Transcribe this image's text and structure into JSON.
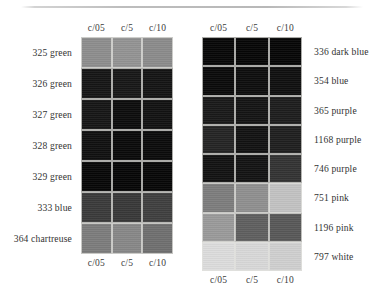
{
  "figure": {
    "type": "color-swatch-grid-figure",
    "divider": "top-horizontal-rule"
  },
  "panels": [
    {
      "id": "left-panel",
      "label_side": "left",
      "columns": [
        "c/05",
        "c/5",
        "c/10"
      ],
      "rows": [
        {
          "label": "325 green",
          "swatches": [
            "#8d8d8d",
            "#939393",
            "#8b8b8b"
          ]
        },
        {
          "label": "326 green",
          "swatches": [
            "#151515",
            "#171717",
            "#141414"
          ]
        },
        {
          "label": "327 green",
          "swatches": [
            "#161616",
            "#0c0c0c",
            "#121212"
          ]
        },
        {
          "label": "328 green",
          "swatches": [
            "#101010",
            "#0a0a0a",
            "#0b0b0b"
          ]
        },
        {
          "label": "329 green",
          "swatches": [
            "#070707",
            "#060606",
            "#070707"
          ]
        },
        {
          "label": "333 blue",
          "swatches": [
            "#3a3a3a",
            "#383838",
            "#3f3f3f"
          ]
        },
        {
          "label": "364 chartreuse",
          "swatches": [
            "#7c7c7c",
            "#878787",
            "#6f6f6f"
          ]
        }
      ]
    },
    {
      "id": "right-panel",
      "label_side": "right",
      "columns": [
        "c/05",
        "c/5",
        "c/10"
      ],
      "rows": [
        {
          "label": "336 dark blue",
          "swatches": [
            "#070707",
            "#060606",
            "#060606"
          ]
        },
        {
          "label": "354 blue",
          "swatches": [
            "#0a0a0a",
            "#0d0d0d",
            "#0f0f0f"
          ]
        },
        {
          "label": "365 purple",
          "swatches": [
            "#191919",
            "#141414",
            "#1d1d1d"
          ]
        },
        {
          "label": "1168 purple",
          "swatches": [
            "#242424",
            "#121212",
            "#1f1f1f"
          ]
        },
        {
          "label": "746 purple",
          "swatches": [
            "#121212",
            "#131313",
            "#333333"
          ]
        },
        {
          "label": "751 pink",
          "swatches": [
            "#7d7d7d",
            "#8f8f8f",
            "#c2c2c2"
          ]
        },
        {
          "label": "1196 pink",
          "swatches": [
            "#9a9a9a",
            "#5f5f5f",
            "#585858"
          ]
        },
        {
          "label": "797 white",
          "swatches": [
            "#dcdcdc",
            "#d8d8d8",
            "#cfcfcf"
          ]
        }
      ]
    }
  ]
}
